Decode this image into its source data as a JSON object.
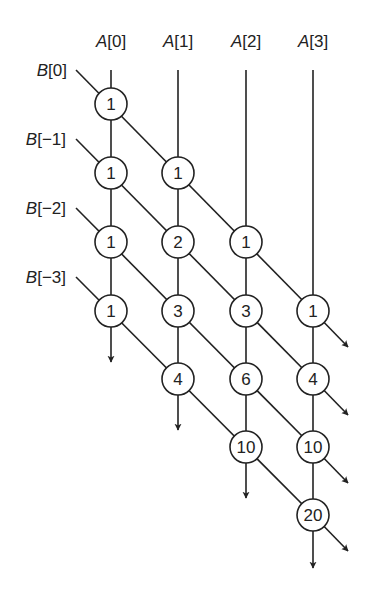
{
  "column_labels": [
    {
      "var": "A",
      "index": "[0]"
    },
    {
      "var": "A",
      "index": "[1]"
    },
    {
      "var": "A",
      "index": "[2]"
    },
    {
      "var": "A",
      "index": "[3]"
    }
  ],
  "row_labels": [
    {
      "var": "B",
      "index": "[0]"
    },
    {
      "var": "B",
      "index": "[−1]"
    },
    {
      "var": "B",
      "index": "[−2]"
    },
    {
      "var": "B",
      "index": "[−3]"
    }
  ],
  "nodes": [
    {
      "col": 0,
      "row": 0,
      "value": "1"
    },
    {
      "col": 0,
      "row": 1,
      "value": "1"
    },
    {
      "col": 1,
      "row": 1,
      "value": "1"
    },
    {
      "col": 0,
      "row": 2,
      "value": "1"
    },
    {
      "col": 1,
      "row": 2,
      "value": "2"
    },
    {
      "col": 2,
      "row": 2,
      "value": "1"
    },
    {
      "col": 0,
      "row": 3,
      "value": "1"
    },
    {
      "col": 1,
      "row": 3,
      "value": "3"
    },
    {
      "col": 2,
      "row": 3,
      "value": "3"
    },
    {
      "col": 3,
      "row": 3,
      "value": "1"
    },
    {
      "col": 1,
      "row": 4,
      "value": "4"
    },
    {
      "col": 2,
      "row": 4,
      "value": "6"
    },
    {
      "col": 3,
      "row": 4,
      "value": "4"
    },
    {
      "col": 2,
      "row": 5,
      "value": "10"
    },
    {
      "col": 3,
      "row": 5,
      "value": "10"
    },
    {
      "col": 3,
      "row": 6,
      "value": "20"
    }
  ],
  "colors": {
    "stroke": "#222222",
    "background": "#ffffff"
  }
}
